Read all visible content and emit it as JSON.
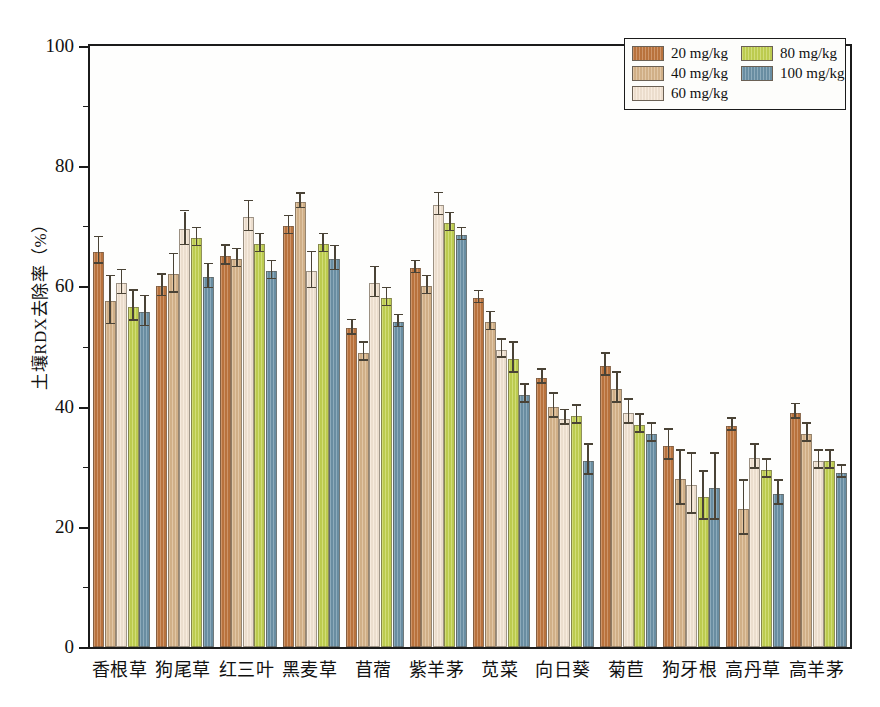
{
  "chart_data": {
    "type": "bar",
    "title": "",
    "xlabel": "",
    "ylabel": "土壤RDX去除率（%）",
    "ylim": [
      0,
      100
    ],
    "ytick_labels": [
      "0",
      "20",
      "40",
      "60",
      "80",
      "100"
    ],
    "ytick_values": [
      0,
      20,
      40,
      60,
      80,
      100
    ],
    "yminor_step": 10,
    "grid": false,
    "legend_position": "top-right",
    "categories": [
      "香根草",
      "狗尾草",
      "红三叶",
      "黑麦草",
      "苜蓿",
      "紫羊茅",
      "苋菜",
      "向日葵",
      "菊苣",
      "狗牙根",
      "高丹草",
      "高羊茅"
    ],
    "series": [
      {
        "name": "20 mg/kg",
        "color": "#c0773f",
        "values": [
          65.8,
          60.0,
          65.0,
          70.0,
          53.0,
          63.0,
          58.0,
          44.8,
          46.8,
          33.5,
          36.8,
          39.0
        ],
        "errors": [
          2.2,
          1.8,
          1.6,
          1.5,
          1.2,
          1.0,
          1.0,
          1.2,
          1.8,
          2.5,
          1.0,
          1.2
        ]
      },
      {
        "name": "40 mg/kg",
        "color": "#d8b68c",
        "values": [
          57.5,
          62.0,
          64.5,
          74.0,
          49.0,
          60.0,
          54.0,
          40.0,
          43.0,
          28.0,
          23.0,
          35.5
        ],
        "errors": [
          4.0,
          3.2,
          1.5,
          1.2,
          1.5,
          1.5,
          1.5,
          2.0,
          2.5,
          4.5,
          4.5,
          1.5
        ]
      },
      {
        "name": "60 mg/kg",
        "color": "#f5e6d5",
        "values": [
          60.5,
          69.5,
          71.5,
          62.5,
          60.5,
          73.5,
          49.5,
          38.0,
          39.0,
          27.0,
          31.5,
          31.0
        ],
        "errors": [
          2.0,
          2.8,
          2.5,
          3.0,
          2.5,
          1.8,
          1.5,
          1.2,
          2.0,
          5.0,
          2.0,
          1.5
        ]
      },
      {
        "name": "80 mg/kg",
        "color": "#c4d352",
        "values": [
          56.6,
          68.0,
          67.0,
          67.0,
          58.0,
          70.5,
          48.0,
          38.5,
          37.0,
          25.0,
          29.5,
          31.0
        ],
        "errors": [
          2.5,
          1.5,
          1.5,
          1.5,
          1.5,
          1.5,
          2.5,
          1.5,
          1.5,
          4.0,
          1.5,
          1.5
        ]
      },
      {
        "name": "100 mg/kg",
        "color": "#6d93a8",
        "values": [
          55.7,
          61.5,
          62.5,
          64.5,
          54.0,
          68.5,
          42.0,
          31.0,
          35.5,
          26.5,
          25.5,
          29.0
        ],
        "errors": [
          2.5,
          2.0,
          1.5,
          2.0,
          1.0,
          1.0,
          1.5,
          2.5,
          1.5,
          5.5,
          2.0,
          1.0
        ]
      }
    ]
  },
  "legend": {
    "items": [
      {
        "label": "20 mg/kg",
        "color": "#c0773f"
      },
      {
        "label": "40 mg/kg",
        "color": "#d8b68c"
      },
      {
        "label": "60 mg/kg",
        "color": "#f5e6d5"
      },
      {
        "label": "80 mg/kg",
        "color": "#c4d352"
      },
      {
        "label": "100 mg/kg",
        "color": "#6d93a8"
      }
    ]
  }
}
